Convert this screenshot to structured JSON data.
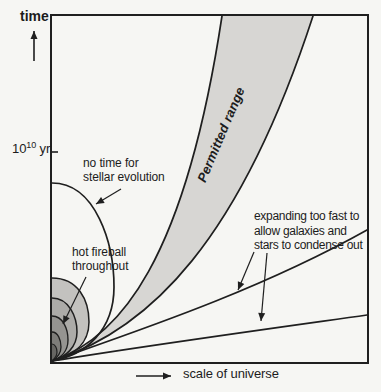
{
  "figure": {
    "y_axis": {
      "label": "time",
      "tick_label_base": "10",
      "tick_label_exponent": "10",
      "tick_label_unit": "yr"
    },
    "x_axis": {
      "label": "scale of universe"
    },
    "band": {
      "label": "Permitted range"
    },
    "annotations": {
      "no_time": {
        "line1": "no time for",
        "line2": "stellar evolution"
      },
      "hot_fireball": {
        "line1": "hot fireball",
        "line2": "throughout"
      },
      "expanding": {
        "line1": "expanding too fast to",
        "line2": "allow galaxies and",
        "line3": "stars to condense out"
      }
    },
    "curves": [
      "permitted-range-band-left-boundary",
      "permitted-range-band-right-boundary",
      "fast-expansion-line-upper",
      "fast-expansion-line-lower",
      "closed-universe-loop-large",
      "hot-fireball-loop-1",
      "hot-fireball-loop-2",
      "hot-fireball-loop-3",
      "hot-fireball-loop-4",
      "hot-fireball-loop-5"
    ]
  },
  "colors": {
    "ink": "#1f1f1f",
    "background": "#f6f6f3",
    "band_fill": "#d7d6d3",
    "loop_fills": [
      "#c3c2bf",
      "#acaba8",
      "#959491",
      "#7e7d7a",
      "#676663"
    ]
  }
}
